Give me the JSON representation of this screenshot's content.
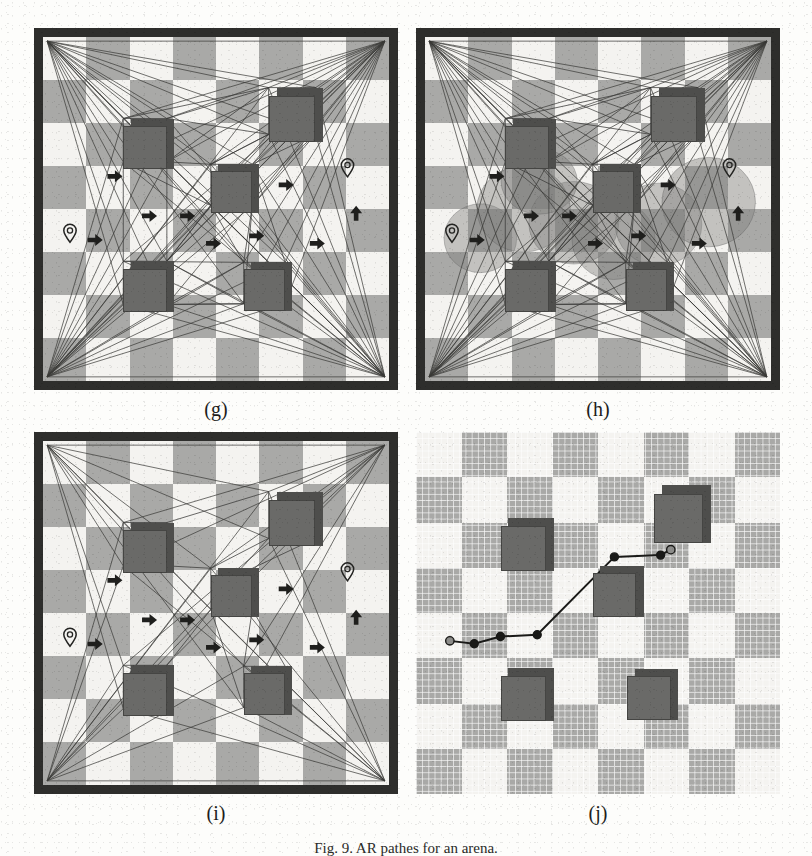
{
  "figure": {
    "caption": "Fig. 9.  AR pathes for an arena.",
    "panels": [
      {
        "id": "g",
        "label": "(g)",
        "kind": "visibility-graph",
        "x": 34,
        "y": 28,
        "w": 364,
        "h": 362,
        "description": "Checkerboard arena with visibility-graph edges, obstacle cubes, heading arrows, start and goal pins"
      },
      {
        "id": "h",
        "label": "(h)",
        "kind": "visibility-graph-with-clearance-blobs",
        "x": 416,
        "y": 28,
        "w": 364,
        "h": 362,
        "description": "Same arena overlaid with translucent circular clearance regions forming a corridor"
      },
      {
        "id": "i",
        "label": "(i)",
        "kind": "visibility-graph-pruned",
        "x": 34,
        "y": 432,
        "w": 364,
        "h": 362,
        "description": "Arena with pruned visibility graph and heading arrows"
      },
      {
        "id": "j",
        "label": "(j)",
        "kind": "waypoint-path-fine-grid",
        "x": 416,
        "y": 432,
        "w": 364,
        "h": 362,
        "description": "Fine grid arena showing final polyline waypoint path from start to goal"
      }
    ],
    "colors": {
      "checker_dark": "#a9a9a7",
      "checker_light": "#f4f3f0",
      "wall": "#2e2e2c",
      "cube_face": "#6a6a68",
      "cube_side": "#4e4e4c",
      "edge": "#3a3a38",
      "arrow": "#1f1f1d",
      "blob": "#7e7e7c",
      "path": "#1a1a18",
      "paper": "#fdfdfb"
    },
    "checker": {
      "cols": 8,
      "rows": 8
    }
  },
  "arena": {
    "cubes": [
      {
        "name": "obstacle-cube-upper-left",
        "cx": 0.295,
        "cy": 0.3,
        "size": 0.125
      },
      {
        "name": "obstacle-cube-upper-right",
        "cx": 0.72,
        "cy": 0.215,
        "size": 0.135
      },
      {
        "name": "obstacle-cube-center",
        "cx": 0.545,
        "cy": 0.43,
        "size": 0.12
      },
      {
        "name": "obstacle-cube-lower-left",
        "cx": 0.295,
        "cy": 0.715,
        "size": 0.125
      },
      {
        "name": "obstacle-cube-lower-right",
        "cx": 0.64,
        "cy": 0.715,
        "size": 0.12
      }
    ],
    "start_pin": {
      "name": "start-pin",
      "cx": 0.078,
      "cy": 0.565
    },
    "goal_pin": {
      "name": "goal-pin",
      "cx": 0.88,
      "cy": 0.375
    },
    "arrows": [
      {
        "cx": 0.205,
        "cy": 0.405,
        "dir": "right"
      },
      {
        "cx": 0.7,
        "cy": 0.43,
        "dir": "right"
      },
      {
        "cx": 0.305,
        "cy": 0.52,
        "dir": "right"
      },
      {
        "cx": 0.415,
        "cy": 0.52,
        "dir": "right"
      },
      {
        "cx": 0.905,
        "cy": 0.515,
        "dir": "up"
      },
      {
        "cx": 0.148,
        "cy": 0.59,
        "dir": "right"
      },
      {
        "cx": 0.49,
        "cy": 0.6,
        "dir": "right"
      },
      {
        "cx": 0.615,
        "cy": 0.578,
        "dir": "right"
      },
      {
        "cx": 0.79,
        "cy": 0.6,
        "dir": "right"
      }
    ],
    "graph_nodes": [
      {
        "x": 0.012,
        "y": 0.012
      },
      {
        "x": 0.988,
        "y": 0.012
      },
      {
        "x": 0.012,
        "y": 0.988
      },
      {
        "x": 0.988,
        "y": 0.988
      },
      {
        "x": 0.232,
        "y": 0.237
      },
      {
        "x": 0.358,
        "y": 0.237
      },
      {
        "x": 0.232,
        "y": 0.363
      },
      {
        "x": 0.358,
        "y": 0.363
      },
      {
        "x": 0.652,
        "y": 0.147
      },
      {
        "x": 0.788,
        "y": 0.147
      },
      {
        "x": 0.652,
        "y": 0.283
      },
      {
        "x": 0.788,
        "y": 0.283
      },
      {
        "x": 0.485,
        "y": 0.37
      },
      {
        "x": 0.605,
        "y": 0.37
      },
      {
        "x": 0.485,
        "y": 0.49
      },
      {
        "x": 0.605,
        "y": 0.49
      },
      {
        "x": 0.232,
        "y": 0.652
      },
      {
        "x": 0.358,
        "y": 0.652
      },
      {
        "x": 0.232,
        "y": 0.778
      },
      {
        "x": 0.358,
        "y": 0.778
      },
      {
        "x": 0.58,
        "y": 0.655
      },
      {
        "x": 0.7,
        "y": 0.655
      },
      {
        "x": 0.58,
        "y": 0.775
      },
      {
        "x": 0.7,
        "y": 0.775
      }
    ]
  },
  "clearance_blobs": [
    {
      "cx": 0.16,
      "cy": 0.585,
      "rx": 0.105,
      "ry": 0.1
    },
    {
      "cx": 0.285,
      "cy": 0.5,
      "rx": 0.135,
      "ry": 0.125
    },
    {
      "cx": 0.43,
      "cy": 0.54,
      "rx": 0.13,
      "ry": 0.12
    },
    {
      "cx": 0.545,
      "cy": 0.59,
      "rx": 0.12,
      "ry": 0.115
    },
    {
      "cx": 0.675,
      "cy": 0.545,
      "rx": 0.125,
      "ry": 0.12
    },
    {
      "cx": 0.82,
      "cy": 0.48,
      "rx": 0.135,
      "ry": 0.13
    },
    {
      "cx": 0.33,
      "cy": 0.42,
      "rx": 0.11,
      "ry": 0.095
    }
  ],
  "waypoint_path": {
    "name": "planned-path",
    "points": [
      {
        "x": 0.093,
        "y": 0.577,
        "type": "start"
      },
      {
        "x": 0.16,
        "y": 0.585,
        "type": "waypoint"
      },
      {
        "x": 0.232,
        "y": 0.565,
        "type": "waypoint"
      },
      {
        "x": 0.333,
        "y": 0.56,
        "type": "waypoint"
      },
      {
        "x": 0.545,
        "y": 0.345,
        "type": "waypoint"
      },
      {
        "x": 0.672,
        "y": 0.34,
        "type": "waypoint"
      },
      {
        "x": 0.7,
        "y": 0.325,
        "type": "goal"
      }
    ]
  }
}
